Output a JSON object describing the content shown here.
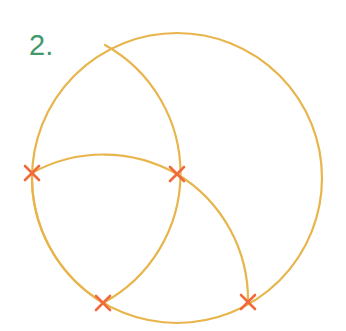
{
  "label": {
    "text": "2.",
    "color": "#3f9a6b"
  },
  "colors": {
    "arc": "#e8b54c",
    "mark": "#ef6a3c",
    "background": "#ffffff"
  },
  "construction": {
    "main_circle": {
      "cx": 177,
      "cy": 178,
      "r": 145
    },
    "intersections": [
      {
        "name": "left",
        "x": 32,
        "y": 173
      },
      {
        "name": "center",
        "x": 177,
        "y": 174
      },
      {
        "name": "bottom-left",
        "x": 103,
        "y": 303
      },
      {
        "name": "bottom-right",
        "x": 248,
        "y": 302
      }
    ],
    "arcs": [
      {
        "name": "arc-top-to-bottom-left",
        "from": [
          105,
          45
        ],
        "to": [
          103,
          303
        ],
        "r": 147,
        "center": "left"
      },
      {
        "name": "arc-lens-top",
        "from": [
          32,
          173
        ],
        "to": [
          177,
          174
        ],
        "r": 148,
        "center": "bottom-left"
      },
      {
        "name": "arc-center-to-bottom-right",
        "from": [
          177,
          174
        ],
        "to": [
          248,
          302
        ],
        "r": 147,
        "center": "bottom-left"
      },
      {
        "name": "arc-left-to-bottom-left",
        "from": [
          32,
          173
        ],
        "to": [
          103,
          303
        ],
        "r": 147,
        "center": "center"
      }
    ]
  }
}
